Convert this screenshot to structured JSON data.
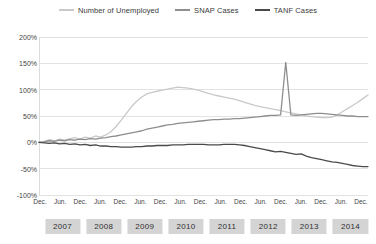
{
  "legend": {
    "items": [
      {
        "label": "Number of Unemployed",
        "color": "#c9c9c9",
        "key": "unemployed"
      },
      {
        "label": "SNAP Cases",
        "color": "#8e8e8e",
        "key": "snap"
      },
      {
        "label": "TANF Cases",
        "color": "#4a4a4a",
        "key": "tanf"
      }
    ]
  },
  "chart_data": {
    "type": "line",
    "title": "",
    "xlabel": "",
    "ylabel": "",
    "ylim": [
      -100,
      200
    ],
    "yticks": [
      200,
      150,
      100,
      50,
      0,
      -50,
      -100
    ],
    "ytick_labels": [
      "200%",
      "150%",
      "100%",
      "50%",
      "0%",
      "-50%",
      "-100%"
    ],
    "grid": true,
    "legend_position": "top",
    "x_tick_labels": [
      "Dec.",
      "Jun.",
      "Dec.",
      "Jun.",
      "Dec.",
      "Jun.",
      "Dec.",
      "Jun.",
      "Dec.",
      "Jun.",
      "Dec.",
      "Jun.",
      "Dec.",
      "Jun.",
      "Dec.",
      "Jun.",
      "Dec."
    ],
    "years": [
      "2007",
      "2008",
      "2009",
      "2010",
      "2011",
      "2012",
      "2013",
      "2014"
    ],
    "x": [
      0,
      1,
      2,
      3,
      4,
      5,
      6,
      7,
      8,
      9,
      10,
      11,
      12,
      13,
      14,
      15,
      16,
      17,
      18,
      19,
      20,
      21,
      22,
      23,
      24,
      25,
      26,
      27,
      28,
      29,
      30,
      31,
      32,
      33,
      34,
      35,
      36,
      37,
      38,
      39,
      40,
      41,
      42,
      43,
      44,
      45,
      46,
      47,
      48,
      49,
      50,
      51,
      52,
      53,
      54,
      55,
      56,
      57,
      58,
      59,
      60,
      61,
      62,
      63,
      64
    ],
    "series": [
      {
        "name": "Number of Unemployed",
        "color": "#c9c9c9",
        "values": [
          0,
          2,
          5,
          3,
          6,
          4,
          7,
          9,
          6,
          10,
          8,
          12,
          10,
          14,
          20,
          30,
          42,
          55,
          68,
          78,
          86,
          92,
          95,
          97,
          99,
          101,
          103,
          105,
          104,
          103,
          101,
          99,
          96,
          93,
          90,
          88,
          86,
          84,
          82,
          79,
          76,
          73,
          70,
          68,
          66,
          64,
          62,
          60,
          58,
          56,
          54,
          52,
          50,
          49,
          48,
          47,
          47,
          48,
          52,
          58,
          64,
          70,
          76,
          83,
          90
        ]
      },
      {
        "name": "SNAP Cases",
        "color": "#8e8e8e",
        "values": [
          0,
          1,
          3,
          2,
          4,
          3,
          5,
          4,
          6,
          5,
          7,
          6,
          8,
          9,
          11,
          12,
          14,
          16,
          18,
          20,
          22,
          25,
          27,
          29,
          31,
          33,
          34,
          36,
          37,
          38,
          39,
          40,
          41,
          42,
          43,
          43,
          44,
          44,
          45,
          45,
          46,
          47,
          48,
          49,
          50,
          51,
          51,
          52,
          152,
          52,
          51,
          52,
          53,
          54,
          55,
          55,
          54,
          53,
          52,
          51,
          50,
          50,
          49,
          49,
          49
        ]
      },
      {
        "name": "TANF Cases",
        "color": "#4a4a4a",
        "values": [
          0,
          -1,
          -2,
          -1,
          -3,
          -2,
          -4,
          -3,
          -5,
          -4,
          -6,
          -5,
          -7,
          -7,
          -8,
          -8,
          -9,
          -9,
          -9,
          -8,
          -8,
          -7,
          -7,
          -6,
          -6,
          -6,
          -5,
          -5,
          -5,
          -4,
          -4,
          -4,
          -4,
          -5,
          -5,
          -5,
          -4,
          -4,
          -4,
          -5,
          -6,
          -8,
          -10,
          -12,
          -14,
          -16,
          -18,
          -17,
          -19,
          -21,
          -23,
          -22,
          -26,
          -29,
          -31,
          -33,
          -35,
          -37,
          -38,
          -40,
          -42,
          -44,
          -45,
          -46,
          -46
        ]
      }
    ]
  }
}
